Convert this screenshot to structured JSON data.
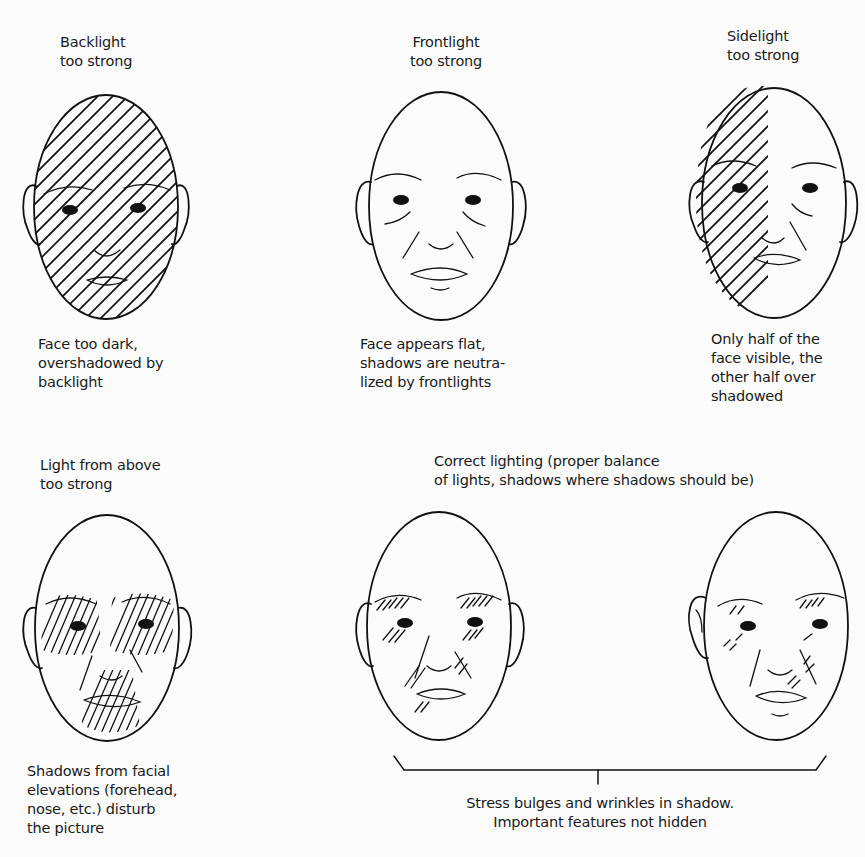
{
  "figure": {
    "panels": [
      {
        "id": "backlight",
        "title": [
          "Backlight",
          "too strong"
        ],
        "caption": [
          "Face too dark,",
          "overshadowed by",
          "backlight"
        ],
        "shading": "full"
      },
      {
        "id": "frontlight",
        "title": [
          "Frontlight",
          "too strong"
        ],
        "caption": [
          "Face appears flat,",
          "shadows are neutra-",
          "lized by frontlights"
        ],
        "shading": "none"
      },
      {
        "id": "sidelight",
        "title": [
          "Sidelight",
          "too strong"
        ],
        "caption": [
          "Only half of the",
          "face visible, the",
          "other half over",
          "shadowed"
        ],
        "shading": "left-half"
      },
      {
        "id": "light-from-above",
        "title": [
          "Light from above",
          "too strong"
        ],
        "caption": [
          "Shadows from facial",
          "elevations (forehead,",
          "nose, etc.) disturb",
          "the picture"
        ],
        "shading": "eyes-and-mouth"
      },
      {
        "id": "correct-lighting",
        "title": [
          "Correct lighting (proper balance",
          "of lights, shadows where shadows should be)"
        ],
        "caption": [
          "Stress bulges and wrinkles in shadow.",
          "Important features not hidden"
        ],
        "shading": "partial",
        "face_count": 2
      }
    ],
    "colors": {
      "ink": "#111111",
      "paper": "#fcfcfc"
    }
  }
}
